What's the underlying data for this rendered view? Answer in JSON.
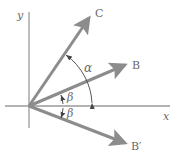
{
  "figure": {
    "axes": {
      "x_label": "x",
      "y_label": "y"
    },
    "vectors": [
      {
        "id": "C",
        "label": "C"
      },
      {
        "id": "B",
        "label": "B"
      },
      {
        "id": "B_prime",
        "label": "B′"
      }
    ],
    "angles": {
      "alpha": "α",
      "beta_upper": "β",
      "beta_lower": "β"
    },
    "colors": {
      "vector": "#8c8c8c",
      "axis": "#9a9a9a",
      "arc": "#555555",
      "label": "#6a6a6a"
    }
  }
}
